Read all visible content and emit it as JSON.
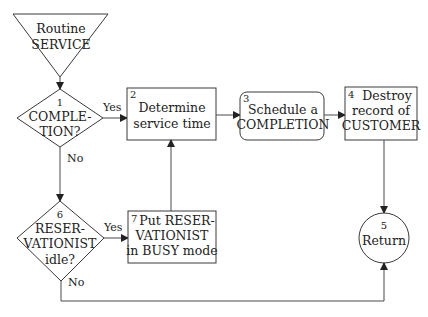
{
  "diagram": {
    "start": {
      "lines": [
        "Routine",
        "SERVICE"
      ]
    },
    "nodes": {
      "n1": {
        "number": "1",
        "lines": [
          "COMPLE-",
          "TION?"
        ]
      },
      "n2": {
        "number": "2",
        "lines": [
          "Determine",
          "service time"
        ]
      },
      "n3": {
        "number": "3",
        "lines": [
          "Schedule a",
          "COMPLETION"
        ]
      },
      "n4": {
        "number": "4",
        "lines": [
          "Destroy",
          "record of",
          "CUSTOMER"
        ]
      },
      "n5": {
        "number": "5",
        "lines": [
          "Return"
        ]
      },
      "n6": {
        "number": "6",
        "lines": [
          "RESER-",
          "VATIONIST",
          "idle?"
        ]
      },
      "n7": {
        "number": "7",
        "lines": [
          "Put RESER-",
          "VATIONIST",
          "in BUSY mode"
        ]
      }
    },
    "edges": {
      "n1_yes": "Yes",
      "n1_no": "No",
      "n6_yes": "Yes",
      "n6_no": "No"
    }
  }
}
